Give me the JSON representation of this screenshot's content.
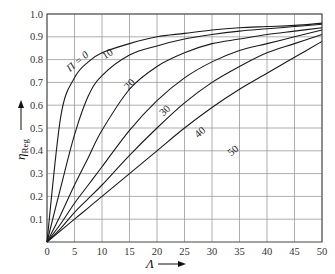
{
  "chart_data": {
    "type": "line",
    "title": "",
    "xlabel": "Λ",
    "ylabel": "η_Reg",
    "xlim": [
      0,
      50
    ],
    "ylim": [
      0,
      1.0
    ],
    "grid": true,
    "x_ticks": [
      "0",
      "5",
      "10",
      "15",
      "20",
      "25",
      "30",
      "35",
      "40",
      "45",
      "50"
    ],
    "y_ticks": [
      "0.1",
      "0.2",
      "0.3",
      "0.4",
      "0.5",
      "0.6",
      "0.7",
      "0.8",
      "0.9",
      "1.0"
    ],
    "parameter_name": "Π",
    "x": [
      0,
      2.5,
      5,
      7.5,
      10,
      15,
      20,
      25,
      30,
      35,
      40,
      45,
      50
    ],
    "series": [
      {
        "name": "Π = 0",
        "label": "Π = 0",
        "values": [
          0,
          0.55,
          0.72,
          0.79,
          0.83,
          0.87,
          0.9,
          0.915,
          0.93,
          0.94,
          0.945,
          0.95,
          0.96
        ]
      },
      {
        "name": "Π = 10",
        "label": "10",
        "values": [
          0,
          0.24,
          0.47,
          0.64,
          0.73,
          0.82,
          0.86,
          0.89,
          0.91,
          0.925,
          0.935,
          0.945,
          0.955
        ]
      },
      {
        "name": "Π = 20",
        "label": "20",
        "values": [
          0,
          0.12,
          0.25,
          0.37,
          0.49,
          0.67,
          0.77,
          0.83,
          0.87,
          0.89,
          0.91,
          0.925,
          0.94
        ]
      },
      {
        "name": "Π = 30",
        "label": "30",
        "values": [
          0,
          0.08,
          0.17,
          0.25,
          0.33,
          0.49,
          0.62,
          0.72,
          0.79,
          0.84,
          0.87,
          0.9,
          0.93
        ]
      },
      {
        "name": "Π = 40",
        "label": "40",
        "values": [
          0,
          0.06,
          0.13,
          0.19,
          0.25,
          0.38,
          0.5,
          0.61,
          0.7,
          0.77,
          0.83,
          0.87,
          0.91
        ]
      },
      {
        "name": "Π = 50",
        "label": "50",
        "values": [
          0,
          0.05,
          0.1,
          0.15,
          0.2,
          0.3,
          0.4,
          0.5,
          0.59,
          0.67,
          0.74,
          0.81,
          0.88
        ]
      }
    ],
    "label_positions": [
      {
        "x": 4.2,
        "y": 0.745,
        "angle": -40
      },
      {
        "x": 10.5,
        "y": 0.8,
        "angle": -32
      },
      {
        "x": 14.8,
        "y": 0.665,
        "angle": -48
      },
      {
        "x": 21.2,
        "y": 0.55,
        "angle": -45
      },
      {
        "x": 27.5,
        "y": 0.455,
        "angle": -42
      },
      {
        "x": 33.5,
        "y": 0.375,
        "angle": -40
      }
    ]
  },
  "colors": {
    "grid": "#9a9a9a",
    "curve": "#1a1a1a",
    "text": "#333333"
  }
}
